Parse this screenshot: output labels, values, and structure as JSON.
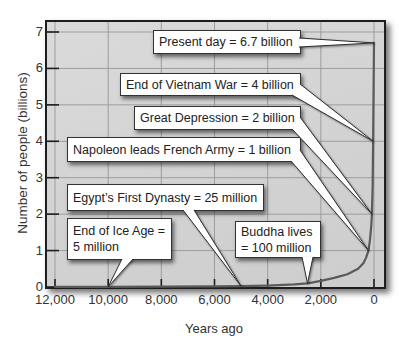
{
  "chart_data": {
    "type": "line",
    "title": "",
    "xlabel": "Years ago",
    "ylabel": "Number of people (billions)",
    "xlim": [
      12000,
      0
    ],
    "ylim": [
      0,
      7
    ],
    "x_reversed": true,
    "grid": true,
    "legend": null,
    "xticks": [
      12000,
      10000,
      8000,
      6000,
      4000,
      2000,
      0
    ],
    "xtick_labels": [
      "12,000",
      "10,000",
      "8,000",
      "6,000",
      "4,000",
      "2,000",
      "0"
    ],
    "yticks": [
      0,
      1,
      2,
      3,
      4,
      5,
      6,
      7
    ],
    "ytick_labels": [
      "0",
      "1",
      "2",
      "3",
      "4",
      "5",
      "6",
      "7"
    ],
    "series": [
      {
        "name": "World population (billions)",
        "x": [
          12000,
          10000,
          8000,
          6000,
          5000,
          4000,
          3000,
          2500,
          2000,
          1500,
          1000,
          600,
          400,
          300,
          208,
          150,
          100,
          78,
          50,
          33,
          15,
          0
        ],
        "y": [
          0.004,
          0.005,
          0.008,
          0.015,
          0.025,
          0.04,
          0.07,
          0.1,
          0.17,
          0.25,
          0.35,
          0.5,
          0.65,
          0.8,
          1.0,
          1.3,
          1.7,
          2.0,
          2.8,
          4.0,
          5.5,
          6.7
        ]
      }
    ],
    "annotations": [
      {
        "lines": [
          "Present day = 6.7 billion"
        ],
        "x": 0,
        "y": 6.7
      },
      {
        "lines": [
          "End of Vietnam War = 4 billion"
        ],
        "x": 33,
        "y": 4
      },
      {
        "lines": [
          "Great Depression = 2 billion"
        ],
        "x": 78,
        "y": 2
      },
      {
        "lines": [
          "Napoleon leads French Army = 1 billion"
        ],
        "x": 208,
        "y": 1
      },
      {
        "lines": [
          "Egypt’s First Dynasty = 25 million"
        ],
        "x": 5000,
        "y": 0.025
      },
      {
        "lines": [
          "End of Ice Age =",
          "5 million"
        ],
        "x": 10000,
        "y": 0.005
      },
      {
        "lines": [
          "Buddha lives",
          "= 100 million"
        ],
        "x": 2500,
        "y": 0.1
      }
    ]
  },
  "colors": {
    "plot_background": "#d4d4d4",
    "gridline": "#9d9d9d",
    "frame": "#1e1e1e",
    "curve": "#5a5a5a",
    "callout_background": "#ffffff"
  }
}
